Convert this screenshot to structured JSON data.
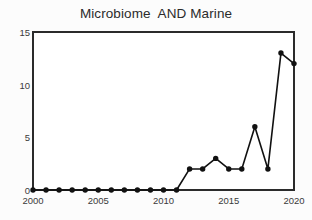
{
  "chart_data": {
    "type": "line",
    "title": "Microbiome  AND Marine",
    "xlabel": "",
    "ylabel": "",
    "x": [
      2000,
      2001,
      2002,
      2003,
      2004,
      2005,
      2006,
      2007,
      2008,
      2009,
      2010,
      2011,
      2012,
      2013,
      2014,
      2015,
      2016,
      2017,
      2018,
      2019,
      2020
    ],
    "values": [
      0,
      0,
      0,
      0,
      0,
      0,
      0,
      0,
      0,
      0,
      0,
      0,
      2,
      2,
      3,
      2,
      2,
      6,
      2,
      13,
      12
    ],
    "series": [
      {
        "name": "Microbiome AND Marine",
        "values": [
          0,
          0,
          0,
          0,
          0,
          0,
          0,
          0,
          0,
          0,
          0,
          0,
          2,
          2,
          3,
          2,
          2,
          6,
          2,
          13,
          12
        ]
      }
    ],
    "xlim": [
      2000,
      2020
    ],
    "ylim": [
      0,
      15
    ],
    "yticks": [
      0,
      5,
      10,
      15
    ],
    "ytick_labels": [
      "0",
      "5",
      "10",
      "15"
    ],
    "xticks": [
      2000,
      2005,
      2010,
      2015,
      2020
    ],
    "xtick_labels": [
      "2000",
      "2005",
      "2010",
      "2015",
      "2020"
    ],
    "grid": false,
    "legend": false,
    "legend_position": "none",
    "marker": "circle",
    "line_color": "#111111",
    "marker_color": "#111111",
    "frame_color": "#2b2b2b",
    "background_color": "#ffffff"
  }
}
